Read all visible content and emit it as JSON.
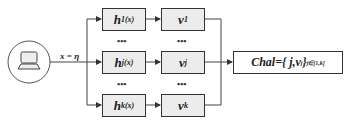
{
  "diagram": {
    "source": {
      "icon": "laptop-icon",
      "edge_label": "x = η"
    },
    "hash_functions": [
      {
        "base": "h",
        "sub": "1(x)"
      },
      {
        "base": "h",
        "sub": "j(x)"
      },
      {
        "base": "h",
        "sub": "k(x)"
      }
    ],
    "values": [
      {
        "base": "v",
        "sub": "1"
      },
      {
        "base": "v",
        "sub": "j"
      },
      {
        "base": "v",
        "sub": "k"
      }
    ],
    "ellipsis": "•••",
    "challenge": {
      "text": "Chal={ j,v",
      "sub_inner": "j",
      "close": " }",
      "sub_outer": "j∈[1,k]"
    },
    "colors": {
      "box_fill": "#ececec",
      "stroke": "#333333"
    }
  }
}
